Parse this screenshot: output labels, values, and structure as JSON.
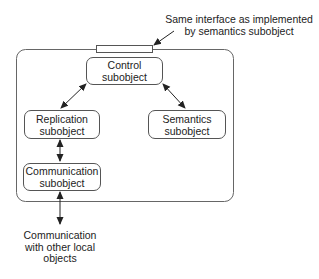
{
  "diagram": {
    "annotation": {
      "line1": "Same interface as implemented",
      "line2": "by semantics subobject"
    },
    "boxes": {
      "control": {
        "line1": "Control",
        "line2": "subobject"
      },
      "replication": {
        "line1": "Replication",
        "line2": "subobject"
      },
      "semantics": {
        "line1": "Semantics",
        "line2": "subobject"
      },
      "communication": {
        "line1": "Communication",
        "line2": "subobject"
      }
    },
    "external": {
      "line1": "Communication",
      "line2": "with other local",
      "line3": "objects"
    },
    "colors": {
      "line": "#333333",
      "box_border": "#555555",
      "background": "#ffffff"
    }
  }
}
